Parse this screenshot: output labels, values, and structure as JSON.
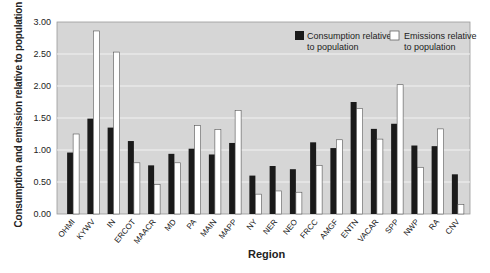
{
  "chart_data": {
    "type": "bar",
    "title": "",
    "xlabel": "Region",
    "ylabel": "Consumption and emission relative to population",
    "ylim": [
      0,
      3
    ],
    "yticks": [
      "0.00",
      "0.50",
      "1.00",
      "1.50",
      "2.00",
      "2.50",
      "3.00"
    ],
    "grid": true,
    "legend_position": "top-right",
    "categories": [
      "OHMI",
      "KYWV",
      "IN",
      "ERCOT",
      "MAACR",
      "MD",
      "PA",
      "MAIN",
      "MAPP",
      "NY",
      "NER",
      "NEO",
      "FRCC",
      "AMGF",
      "ENTN",
      "VACAR",
      "SPP",
      "NWP",
      "RA",
      "CNV"
    ],
    "series": [
      {
        "name": "Consumption relative to population",
        "color": "#1a1a1a",
        "values": [
          0.96,
          1.49,
          1.35,
          1.14,
          0.76,
          0.94,
          1.02,
          0.93,
          1.11,
          0.6,
          0.75,
          0.7,
          1.12,
          1.03,
          1.75,
          1.33,
          1.41,
          1.07,
          1.06,
          0.62
        ]
      },
      {
        "name": "Emissions relative to population",
        "color": "#ffffff",
        "values": [
          1.25,
          2.86,
          2.53,
          0.8,
          0.46,
          0.8,
          1.38,
          1.32,
          1.62,
          0.31,
          0.36,
          0.34,
          0.76,
          1.16,
          1.65,
          1.17,
          2.02,
          0.73,
          1.33,
          0.15
        ]
      }
    ]
  },
  "legend": {
    "consumption_line1": "Consumption relative",
    "consumption_line2": "to population",
    "emissions_line1": "Emissions relative",
    "emissions_line2": "to population"
  },
  "axes": {
    "ylabel": "Consumption and emission relative to population",
    "xlabel": "Region"
  },
  "colors": {
    "plot_bg": "#d6d6d6",
    "grid": "#f2f2f2",
    "bar_dark": "#1a1a1a",
    "bar_light": "#ffffff"
  }
}
